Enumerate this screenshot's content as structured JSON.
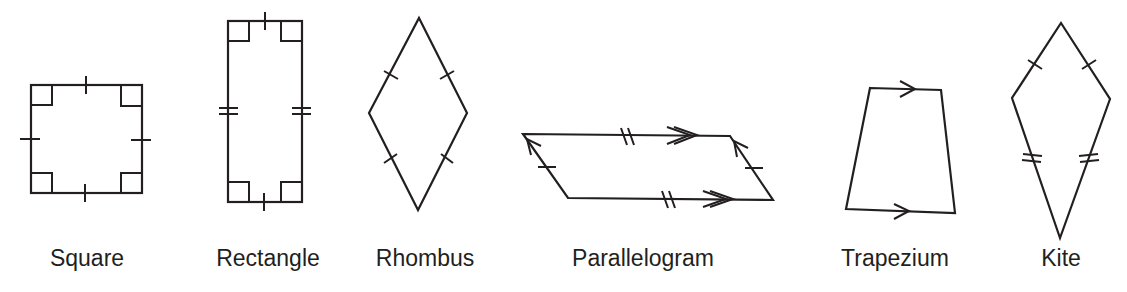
{
  "figure": {
    "background": "#ffffff",
    "stroke_color": "#231f20",
    "shapes": [
      {
        "id": "square",
        "label": "Square",
        "marks": "4 equal sides (single ticks), 4 right angles"
      },
      {
        "id": "rectangle",
        "label": "Rectangle",
        "marks": "opposite sides equal (single & double ticks), 4 right angles"
      },
      {
        "id": "rhombus",
        "label": "Rhombus",
        "marks": "4 equal sides (single ticks)"
      },
      {
        "id": "parallelogram",
        "label": "Parallelogram",
        "marks": "opposite sides equal (double/single ticks) and parallel (double/single arrows)"
      },
      {
        "id": "trapezium",
        "label": "Trapezium",
        "marks": "one pair of parallel sides (single arrows)"
      },
      {
        "id": "kite",
        "label": "Kite",
        "marks": "two pairs of adjacent equal sides (single & double ticks)"
      }
    ]
  }
}
